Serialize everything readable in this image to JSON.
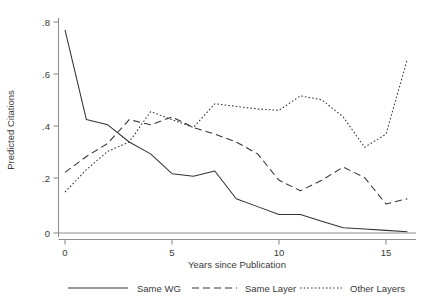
{
  "chart_data": {
    "type": "line",
    "title": "",
    "xlabel": "Years since Publication",
    "ylabel": "Predicted Citations",
    "x": [
      0,
      1,
      2,
      3,
      4,
      5,
      6,
      7,
      8,
      9,
      10,
      11,
      12,
      13,
      14,
      15,
      16
    ],
    "xlim": [
      0,
      16
    ],
    "ylim": [
      0,
      0.8
    ],
    "xticks": [
      0,
      5,
      10,
      15
    ],
    "xtick_labels": [
      "0",
      "5",
      "10",
      "15"
    ],
    "yticks": [
      0,
      0.2,
      0.4,
      0.6,
      0.8
    ],
    "ytick_labels": [
      "0",
      ".2",
      ".4",
      ".6",
      ".8"
    ],
    "grid": false,
    "legend_position": "bottom",
    "series": [
      {
        "name": "Same WG",
        "style": "solid",
        "color": "#333333",
        "values": [
          0.77,
          0.43,
          0.41,
          0.345,
          0.3,
          0.225,
          0.215,
          0.235,
          0.13,
          0.1,
          0.07,
          0.07,
          0.045,
          0.02,
          0.015,
          0.01,
          0.005
        ]
      },
      {
        "name": "Same Layer",
        "style": "dashed",
        "color": "#333333",
        "values": [
          0.23,
          0.29,
          0.34,
          0.43,
          0.41,
          0.44,
          0.4,
          0.375,
          0.345,
          0.3,
          0.2,
          0.16,
          0.2,
          0.25,
          0.21,
          0.11,
          0.13
        ]
      },
      {
        "name": "Other Layers",
        "style": "dotted",
        "color": "#333333",
        "values": [
          0.155,
          0.24,
          0.31,
          0.345,
          0.46,
          0.43,
          0.4,
          0.49,
          0.48,
          0.47,
          0.465,
          0.52,
          0.505,
          0.44,
          0.325,
          0.375,
          0.66
        ]
      }
    ]
  },
  "legend": {
    "items": [
      {
        "label": "Same WG",
        "style": "solid"
      },
      {
        "label": "Same Layer",
        "style": "dashed"
      },
      {
        "label": "Other Layers",
        "style": "dotted"
      }
    ]
  }
}
